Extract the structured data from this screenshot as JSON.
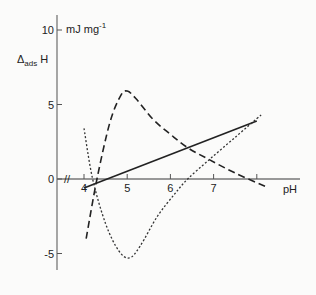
{
  "chart_data": {
    "type": "line",
    "title": "",
    "ylabel_main": "Δ",
    "ylabel_sub": "ads",
    "ylabel_tail": " H",
    "yunit_main": "mJ mg",
    "yunit_sup": "-1",
    "xlabel": "pH",
    "xlim": [
      4,
      8
    ],
    "ylim": [
      -6,
      10
    ],
    "axis_break": "//",
    "x_ticks": [
      {
        "v": 4,
        "label": "4"
      },
      {
        "v": 5,
        "label": "5"
      },
      {
        "v": 6,
        "label": "6"
      },
      {
        "v": 7,
        "label": "7"
      },
      {
        "v": 8,
        "label": ""
      }
    ],
    "y_ticks": [
      {
        "v": 10,
        "label": "10"
      },
      {
        "v": 5,
        "label": "5"
      },
      {
        "v": 0,
        "label": "0"
      },
      {
        "v": -5,
        "label": "-5"
      }
    ],
    "grid": false,
    "legend": "none",
    "series": [
      {
        "name": "solid",
        "style": "solid",
        "x": [
          4.0,
          8.0
        ],
        "y": [
          -0.6,
          3.9
        ]
      },
      {
        "name": "dashed",
        "style": "dashed",
        "x": [
          4.05,
          4.3,
          4.6,
          4.85,
          5.0,
          5.2,
          5.6,
          6.0,
          6.4,
          6.9,
          7.5,
          8.2
        ],
        "y": [
          -4.0,
          0.0,
          3.8,
          5.6,
          5.9,
          5.4,
          4.0,
          3.0,
          2.1,
          1.3,
          0.4,
          -0.5
        ]
      },
      {
        "name": "dotted",
        "style": "dotted",
        "x": [
          4.0,
          4.2,
          4.5,
          4.8,
          5.05,
          5.3,
          5.7,
          6.1,
          6.4,
          6.9,
          7.5,
          8.1
        ],
        "y": [
          3.4,
          0.0,
          -3.0,
          -4.8,
          -5.3,
          -4.5,
          -2.5,
          -1.0,
          0.0,
          1.3,
          2.8,
          4.3
        ]
      }
    ]
  }
}
